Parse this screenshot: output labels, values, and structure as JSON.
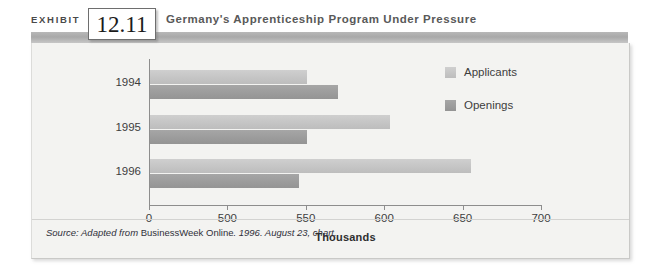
{
  "exhibit": {
    "label": "EXHIBIT",
    "number": "12.11",
    "title": "Germany's Apprenticeship Program Under Pressure"
  },
  "source": {
    "prefix": "Source: Adapted from ",
    "publication": "BusinessWeek Online",
    "suffix": ". 1996. August 23, chart."
  },
  "colors": {
    "applicants": "#c4c4c4",
    "openings": "#9b9b9b",
    "panel_background": "#f3f3f1",
    "header_band": "#a9a9a9",
    "axis": "#8d8d8d"
  },
  "chart_data": {
    "type": "bar",
    "orientation": "horizontal",
    "title": "Germany's Apprenticeship Program Under Pressure",
    "xlabel": "Thousands",
    "ylabel": "",
    "categories": [
      "1994",
      "1995",
      "1996"
    ],
    "series": [
      {
        "name": "Applicants",
        "values": [
          550,
          603,
          655
        ]
      },
      {
        "name": "Openings",
        "values": [
          570,
          550,
          545
        ]
      }
    ],
    "xticks": [
      0,
      500,
      550,
      600,
      650,
      700
    ],
    "xtick_labels": [
      "0",
      "500",
      "550",
      "600",
      "650",
      "700"
    ],
    "axis_note": "x-axis uses a broken scale: 0 is followed directly by 500, then even 50-unit steps",
    "xlim": [
      0,
      700
    ],
    "grid": false,
    "legend": [
      "Applicants",
      "Openings"
    ],
    "legend_position": "right-top"
  }
}
